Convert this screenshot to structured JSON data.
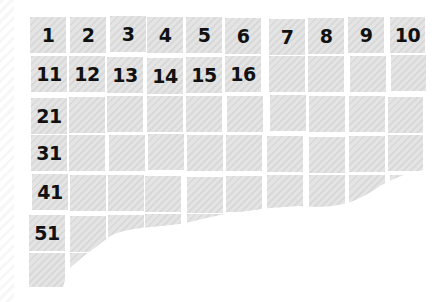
{
  "grid": {
    "columns": 10,
    "rows": 7,
    "labels": [
      [
        "1",
        "2",
        "3",
        "4",
        "5",
        "6",
        "7",
        "8",
        "9",
        "10"
      ],
      [
        "11",
        "12",
        "13",
        "14",
        "15",
        "16",
        "",
        "",
        "",
        ""
      ],
      [
        "21",
        "",
        "",
        "",
        "",
        "",
        "",
        "",
        "",
        ""
      ],
      [
        "31",
        "",
        "",
        "",
        "",
        "",
        "",
        "",
        "",
        ""
      ],
      [
        "41",
        "",
        "",
        "",
        "",
        "",
        "",
        "",
        "",
        ""
      ],
      [
        "51",
        "",
        "",
        "",
        "",
        "",
        "",
        "",
        "",
        ""
      ],
      [
        "",
        "",
        "",
        "",
        "",
        "",
        "",
        "",
        "",
        ""
      ]
    ]
  },
  "colors": {
    "tile": "#dddddd",
    "text": "#111111",
    "background": "#ffffff"
  }
}
